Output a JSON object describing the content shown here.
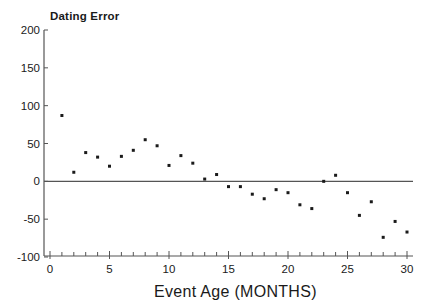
{
  "chart_data": {
    "type": "scatter",
    "title": "Dating Error",
    "xlabel": "Event Age (MONTHS)",
    "ylabel": "Dating Error",
    "xlim": [
      0,
      30
    ],
    "ylim": [
      -100,
      200
    ],
    "x_ticks": [
      0,
      5,
      10,
      15,
      20,
      25,
      30
    ],
    "y_ticks": [
      -100,
      -50,
      0,
      50,
      100,
      150,
      200
    ],
    "x_minor_tick_step": 1,
    "grid": false,
    "legend": null,
    "reference_line": {
      "y": 0
    },
    "series": [
      {
        "name": "Dating Error",
        "x": [
          1,
          2,
          3,
          4,
          5,
          6,
          7,
          8,
          9,
          10,
          11,
          12,
          13,
          14,
          15,
          16,
          17,
          18,
          19,
          20,
          21,
          22,
          23,
          24,
          25,
          26,
          27,
          28,
          29,
          30
        ],
        "y": [
          87,
          12,
          38,
          32,
          20,
          33,
          41,
          55,
          47,
          21,
          34,
          24,
          3,
          9,
          -7,
          -7,
          -17,
          -23,
          -11,
          -15,
          -31,
          -36,
          0,
          8,
          -15,
          -45,
          -27,
          -74,
          -53,
          -67
        ]
      }
    ],
    "colors": {
      "ink": "#1a1a1a",
      "axis": "#555555",
      "background": "#ffffff"
    }
  }
}
